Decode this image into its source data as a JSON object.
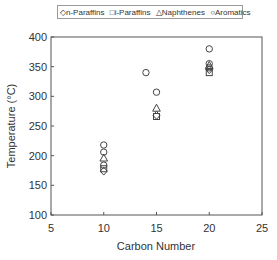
{
  "chart_data": {
    "type": "scatter",
    "title": "",
    "xlabel": "Carbon Number",
    "ylabel": "Temperature (°C)",
    "xlim": [
      5,
      25
    ],
    "ylim": [
      100,
      400
    ],
    "xticks": [
      5,
      10,
      15,
      20,
      25
    ],
    "yticks": [
      100,
      150,
      200,
      250,
      300,
      350,
      400
    ],
    "grid": false,
    "legend_position": "top",
    "series": [
      {
        "name": "n-Paraffins",
        "marker": "diamond",
        "points": [
          [
            10,
            174
          ],
          [
            15,
            268
          ],
          [
            20,
            345
          ]
        ]
      },
      {
        "name": "i-Paraffins",
        "marker": "square",
        "points": [
          [
            10,
            178
          ],
          [
            15,
            266
          ],
          [
            20,
            340
          ]
        ]
      },
      {
        "name": "Naphthenes",
        "marker": "triangle",
        "points": [
          [
            10,
            196
          ],
          [
            15,
            280
          ],
          [
            20,
            352
          ]
        ]
      },
      {
        "name": "Aromatics",
        "marker": "circle",
        "points": [
          [
            10,
            218
          ],
          [
            10,
            206
          ],
          [
            10,
            184
          ],
          [
            14,
            340
          ],
          [
            15,
            307
          ],
          [
            20,
            380
          ],
          [
            20,
            355
          ],
          [
            20,
            348
          ]
        ]
      }
    ]
  },
  "legend": {
    "items": [
      {
        "symbol": "◇",
        "label": "n-Paraffins"
      },
      {
        "symbol": "□",
        "label": "i-Paraffins"
      },
      {
        "symbol": "△",
        "label": "Naphthenes"
      },
      {
        "symbol": "○",
        "label": "Aromatics"
      }
    ]
  },
  "axes": {
    "x_title": "Carbon Number",
    "y_title": "Temperature (°C)",
    "x_ticks": [
      "5",
      "10",
      "15",
      "20",
      "25"
    ],
    "y_ticks": [
      "400",
      "350",
      "300",
      "250",
      "200",
      "150",
      "100"
    ]
  }
}
